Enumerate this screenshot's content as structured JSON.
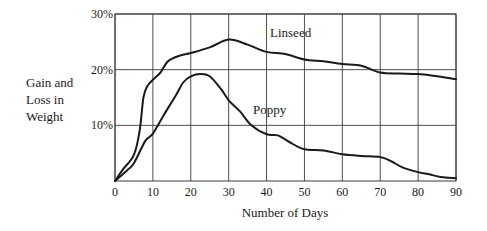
{
  "chart_data": {
    "type": "line",
    "title": "",
    "xlabel": "Number of Days",
    "ylabel": [
      "Gain and",
      "Loss in",
      "Weight"
    ],
    "xlim": [
      0,
      90
    ],
    "ylim": [
      0,
      30
    ],
    "x_ticks": [
      0,
      10,
      20,
      30,
      40,
      50,
      60,
      70,
      80,
      90
    ],
    "x_tick_labels": [
      "0",
      "10",
      "20",
      "30",
      "40",
      "50",
      "60",
      "70",
      "80",
      "90"
    ],
    "y_ticks": [
      10,
      20,
      30
    ],
    "y_tick_labels": [
      "10%",
      "20%",
      "30%"
    ],
    "grid": true,
    "legend": "inline labels",
    "series": [
      {
        "name": "Linseed",
        "label_position": "above curve near day 45",
        "x": [
          0,
          2,
          5,
          6.5,
          7.5,
          8.5,
          10,
          12,
          14,
          17,
          20,
          25,
          30,
          35,
          40,
          45,
          50,
          55,
          60,
          65,
          70,
          75,
          80,
          85,
          90
        ],
        "y": [
          0,
          2,
          4.7,
          9,
          15,
          17,
          18.2,
          19.5,
          21.5,
          22.5,
          23,
          24,
          25.4,
          24.5,
          23.2,
          22.8,
          21.8,
          21.5,
          21,
          20.7,
          19.5,
          19.3,
          19.2,
          18.8,
          18.3
        ]
      },
      {
        "name": "Poppy",
        "label_position": "right of curve near day 37",
        "x": [
          0,
          3,
          5,
          8,
          10,
          13,
          16,
          18,
          20,
          22.5,
          25,
          28,
          30,
          33,
          36,
          40,
          43,
          46,
          50,
          55,
          60,
          65,
          70,
          73,
          76,
          80,
          83,
          86,
          90
        ],
        "y": [
          0,
          1.8,
          3.2,
          7.2,
          8.5,
          12,
          15.3,
          17.7,
          18.8,
          19.2,
          18.8,
          16.5,
          14.5,
          12.5,
          10,
          8.4,
          8.2,
          7,
          5.7,
          5.5,
          4.8,
          4.5,
          4.3,
          3.5,
          2.4,
          1.6,
          1.2,
          0.7,
          0.5
        ]
      }
    ]
  },
  "colors": {
    "line": "#1a1a1a",
    "grid": "#3a3a3a",
    "background": "#ffffff"
  }
}
